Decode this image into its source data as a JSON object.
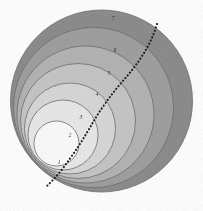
{
  "figure": {
    "type": "diagram",
    "background_color": "#ffffff",
    "outline_color": "#6f6f6f",
    "curve": {
      "name": "dotted-spiral-curve",
      "style": "dotted",
      "color": "#1d1d1d",
      "path": "M 157 24 C 150 48, 136 66, 122 82 C 110 96, 100 110, 92 124 C 84 138, 74 154, 60 172 C 55 178, 50 183, 46 187"
    },
    "tangent_point": {
      "x": 46,
      "y": 188
    },
    "circles": [
      {
        "label": "7",
        "cx": 101.5,
        "cy": 101.0,
        "r": 91.0,
        "fill": "#8d8d8d",
        "label_x": 113,
        "label_y": 19
      },
      {
        "label": "6",
        "cx": 93.5,
        "cy": 107.5,
        "r": 80.0,
        "fill": "#a0a0a0",
        "label_x": 115,
        "label_y": 51
      },
      {
        "label": "5",
        "cx": 85.5,
        "cy": 114.5,
        "r": 68.5,
        "fill": "#b4b4b4",
        "label_x": 109,
        "label_y": 74
      },
      {
        "label": "4",
        "cx": 78.0,
        "cy": 121.0,
        "r": 57.5,
        "fill": "#c6c6c6",
        "label_x": 97,
        "label_y": 95
      },
      {
        "label": "3",
        "cx": 70.0,
        "cy": 128.5,
        "r": 45.5,
        "fill": "#d8d8d8",
        "label_x": 81,
        "label_y": 118
      },
      {
        "label": "2",
        "cx": 63.0,
        "cy": 135.0,
        "r": 35.0,
        "fill": "#e9e9e9",
        "label_x": 70,
        "label_y": 136
      },
      {
        "label": "1",
        "cx": 56.5,
        "cy": 143.5,
        "r": 22.5,
        "fill": "#fbfbfb",
        "label_x": 59,
        "label_y": 163
      }
    ]
  }
}
